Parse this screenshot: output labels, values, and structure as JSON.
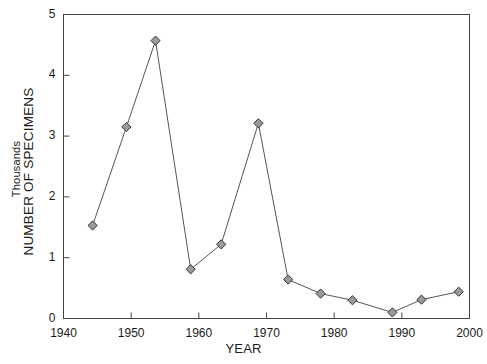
{
  "chart_data": {
    "type": "line",
    "title": "",
    "xlabel": "YEAR",
    "ylabel": "NUMBER OF SPECIMENS",
    "ylabel_secondary": "Thousands",
    "xlim": [
      1940,
      2000
    ],
    "ylim": [
      0,
      5
    ],
    "xticks": [
      1940,
      1950,
      1960,
      1970,
      1980,
      1990,
      2000
    ],
    "yticks": [
      0,
      1,
      2,
      3,
      4,
      5
    ],
    "xtick_labels": [
      "1940",
      "1950",
      "1960",
      "1970",
      "1980",
      "1990",
      "2000"
    ],
    "ytick_labels": [
      "0",
      "1",
      "2",
      "3",
      "4",
      "5"
    ],
    "grid": false,
    "legend": false,
    "marker": "diamond",
    "line_color": "#555555",
    "marker_fill": "#9a9a9a",
    "marker_edge": "#333333",
    "frame_color": "#444444",
    "x": [
      1944.3,
      1949.3,
      1953.6,
      1958.8,
      1963.3,
      1968.8,
      1973.2,
      1978.0,
      1982.7,
      1988.6,
      1992.9,
      1998.4
    ],
    "values": [
      1.53,
      3.15,
      4.57,
      0.81,
      1.22,
      3.21,
      0.64,
      0.41,
      0.3,
      0.1,
      0.31,
      0.44
    ],
    "series": [
      {
        "name": "Number of specimens (thousands)",
        "points": [
          {
            "x": 1944.3,
            "y": 1.53
          },
          {
            "x": 1949.3,
            "y": 3.15
          },
          {
            "x": 1953.6,
            "y": 4.57
          },
          {
            "x": 1958.8,
            "y": 0.81
          },
          {
            "x": 1963.3,
            "y": 1.22
          },
          {
            "x": 1968.8,
            "y": 3.21
          },
          {
            "x": 1973.2,
            "y": 0.64
          },
          {
            "x": 1978.0,
            "y": 0.41
          },
          {
            "x": 1982.7,
            "y": 0.3
          },
          {
            "x": 1988.6,
            "y": 0.1
          },
          {
            "x": 1992.9,
            "y": 0.31
          },
          {
            "x": 1998.4,
            "y": 0.44
          }
        ]
      }
    ]
  },
  "axes": {
    "y_title_outer": "NUMBER OF SPECIMENS",
    "y_title_inner": "Thousands",
    "x_title": "YEAR"
  },
  "colors": {
    "frame": "#444444",
    "line": "#555555",
    "marker_fill": "#9a9a9a",
    "marker_edge": "#333333",
    "text": "#1a1a1a",
    "background": "#ffffff"
  }
}
